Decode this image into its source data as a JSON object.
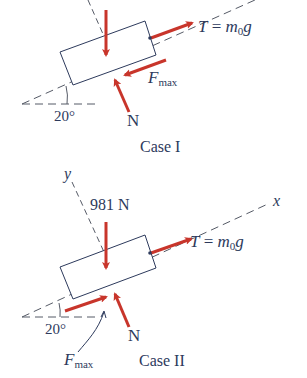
{
  "colors": {
    "ink": "#2d3a5c",
    "force": "#c8352b",
    "dash": "#555a66"
  },
  "case1": {
    "caption": "Case I",
    "angle": "20°",
    "tension": {
      "lhs": "T",
      "eq": " = ",
      "m": "m",
      "sub": "0",
      "g": "g"
    },
    "friction": {
      "F": "F",
      "sub": "max"
    },
    "normal": "N"
  },
  "case2": {
    "caption": "Case II",
    "angle": "20°",
    "weight": "981 N",
    "x_axis": "x",
    "y_axis": "y",
    "tension": {
      "lhs": "T",
      "eq": " = ",
      "m": "m",
      "sub": "0",
      "g": "g"
    },
    "friction": {
      "F": "F",
      "sub": "max"
    },
    "normal": "N"
  }
}
